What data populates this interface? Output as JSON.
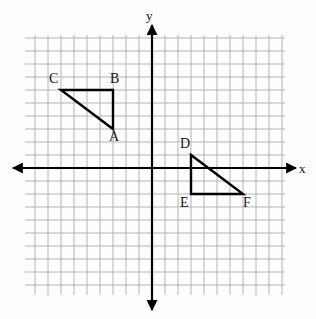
{
  "figure": {
    "title": "",
    "background_color": "#fdfdfd",
    "width": 316,
    "height": 319
  },
  "chart_data": {
    "type": "scatter",
    "title": "",
    "xlabel": "x",
    "ylabel": "y",
    "grid": true,
    "legend": null,
    "xlim": [
      -10,
      10
    ],
    "ylim": [
      -10,
      10
    ],
    "grid_step": 1,
    "tick_labels_shown": false,
    "axis_color": "#000000",
    "grid_color": "#b4b4b4",
    "shape_color": "#000000",
    "origin_px": {
      "x": 152,
      "y": 168
    },
    "cell_px": 13,
    "grid_bounds_px": {
      "left": 25,
      "top": 35,
      "right": 285,
      "bottom": 295
    },
    "axis_arrows": {
      "x_left_px": 13,
      "x_right_px": 296,
      "y_top_px": 25,
      "y_bottom_px": 310
    },
    "axis_labels": [
      {
        "name": "x-axis-label",
        "text": "x",
        "x_px": 299,
        "y_px": 162
      },
      {
        "name": "y-axis-label",
        "text": "y",
        "x_px": 146,
        "y_px": 9
      }
    ],
    "shapes": [
      {
        "name": "triangle-ABC",
        "kind": "triangle",
        "closed": true,
        "points_units": [
          {
            "label": "A",
            "x": -3,
            "y": 3
          },
          {
            "label": "B",
            "x": -3,
            "y": 6
          },
          {
            "label": "C",
            "x": -7,
            "y": 6
          }
        ],
        "points_px": [
          {
            "label": "A",
            "x": 113,
            "y": 129
          },
          {
            "label": "B",
            "x": 113,
            "y": 90
          },
          {
            "label": "C",
            "x": 61,
            "y": 90
          }
        ],
        "vertex_labels": [
          {
            "text": "A",
            "x_px": 109,
            "y_px": 130
          },
          {
            "text": "B",
            "x_px": 110,
            "y_px": 72
          },
          {
            "text": "C",
            "x_px": 49,
            "y_px": 72
          }
        ]
      },
      {
        "name": "triangle-DEF",
        "kind": "triangle",
        "closed": true,
        "points_units": [
          {
            "label": "D",
            "x": 3,
            "y": 1
          },
          {
            "label": "E",
            "x": 3,
            "y": -2
          },
          {
            "label": "F",
            "x": 7,
            "y": -2
          }
        ],
        "points_px": [
          {
            "label": "D",
            "x": 191,
            "y": 155
          },
          {
            "label": "E",
            "x": 191,
            "y": 194
          },
          {
            "label": "F",
            "x": 243,
            "y": 194
          }
        ],
        "vertex_labels": [
          {
            "text": "D",
            "x_px": 180,
            "y_px": 137
          },
          {
            "text": "E",
            "x_px": 180,
            "y_px": 196
          },
          {
            "text": "F",
            "x_px": 243,
            "y_px": 196
          }
        ]
      }
    ]
  }
}
